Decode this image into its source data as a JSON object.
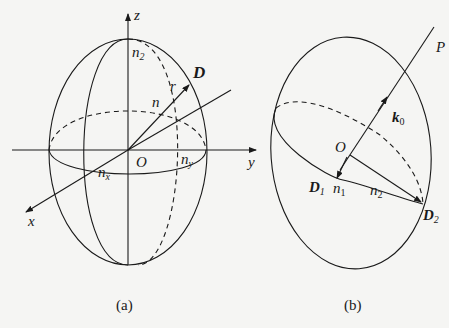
{
  "figure_a": {
    "caption": "(a)",
    "axis_z": "z",
    "axis_y": "y",
    "axis_x": "x",
    "origin": "O",
    "vector": "D",
    "r_label": "r",
    "n_label": "n",
    "n2_base": "n",
    "n2_sub": "2",
    "nx_base": "n",
    "nx_sub": "x",
    "ny_base": "n",
    "ny_sub": "y"
  },
  "figure_b": {
    "caption": "(b)",
    "line_label": "P",
    "origin": "O",
    "k0_base": "k",
    "k0_sub": "0",
    "d1_base": "D",
    "d1_sub": "1",
    "d2_base": "D",
    "d2_sub": "2",
    "n1_base": "n",
    "n1_sub": "1",
    "n2_base": "n",
    "n2_sub": "2"
  },
  "colors": {
    "stroke": "#1a1a1a",
    "background": "#f5f5f3"
  }
}
